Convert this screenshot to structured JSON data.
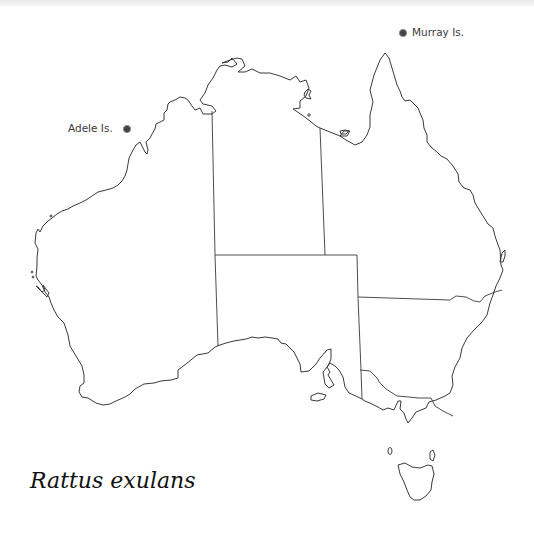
{
  "title": "Rattus exulans",
  "locations": [
    {
      "name": "Murray Is.",
      "marker": "dot-icon"
    },
    {
      "name": "Adele Is.",
      "marker": "dot-icon"
    }
  ],
  "map": {
    "region": "Australia",
    "style": "outline map with state borders",
    "stroke_color": "#3a3a3a",
    "marker_color": "#333333"
  }
}
